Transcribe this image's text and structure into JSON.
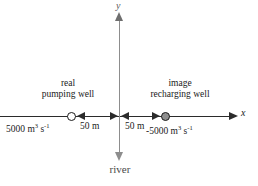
{
  "diagram": {
    "axes": {
      "x_label": "x",
      "y_label": "y",
      "x_axis_color": "#2b2b2b",
      "y_axis_color": "#8d8d8d"
    },
    "river": {
      "label": "river",
      "color": "#8d8d8d"
    },
    "wells": [
      {
        "name": "real-pumping-well",
        "caption_line1": "real",
        "caption_line2": "pumping well",
        "rate_value": "5000",
        "rate_unit_m": "m",
        "rate_unit_m_sup": "3",
        "rate_unit_s": "s",
        "rate_unit_s_sup": "-1",
        "distance": "50 m",
        "marker_fill": "#ffffff",
        "marker_stroke": "#1a1a1a"
      },
      {
        "name": "image-recharging-well",
        "caption_line1": "image",
        "caption_line2": "recharging well",
        "rate_value": "-5000",
        "rate_unit_m": "m",
        "rate_unit_m_sup": "3",
        "rate_unit_s": "s",
        "rate_unit_s_sup": "-1",
        "distance": "50 m",
        "marker_fill": "#8e8e8e",
        "marker_stroke": "#1a1a1a"
      }
    ]
  }
}
